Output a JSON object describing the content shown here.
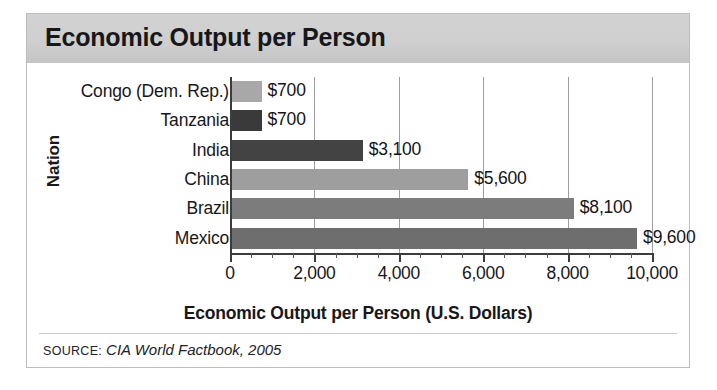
{
  "figure": {
    "title": "Economic Output per Person",
    "y_axis_title": "Nation",
    "x_axis_title": "Economic Output per Person (U.S. Dollars)",
    "source_label": "SOURCE:",
    "source_text": "CIA World Factbook, 2005"
  },
  "chart_data": {
    "type": "bar",
    "orientation": "horizontal",
    "title": "Economic Output per Person",
    "xlabel": "Economic Output per Person (U.S. Dollars)",
    "ylabel": "Nation",
    "xlim": [
      0,
      10000
    ],
    "grid": true,
    "legend": "none",
    "x_ticks": [
      0,
      2000,
      4000,
      6000,
      8000,
      10000
    ],
    "x_tick_labels": [
      "0",
      "2,000",
      "4,000",
      "6,000",
      "8,000",
      "10,000"
    ],
    "minor_tick_step": 500,
    "categories": [
      "Congo (Dem. Rep.)",
      "Tanzania",
      "India",
      "China",
      "Brazil",
      "Mexico"
    ],
    "values": [
      700,
      700,
      3100,
      5600,
      8100,
      9600
    ],
    "data_labels": [
      "$700",
      "$700",
      "$3,100",
      "$5,600",
      "$8,100",
      "$9,600"
    ],
    "bar_colors": [
      "#a8a8a8",
      "#3a3a3a",
      "#434343",
      "#9e9e9e",
      "#7c7c7c",
      "#6e6e6e"
    ]
  },
  "style": {
    "banner_color": "#cccccc",
    "axis_color": "#3c3c3c",
    "gridline_color": "#9d9d9d",
    "frame_color": "#bdbdbd"
  }
}
